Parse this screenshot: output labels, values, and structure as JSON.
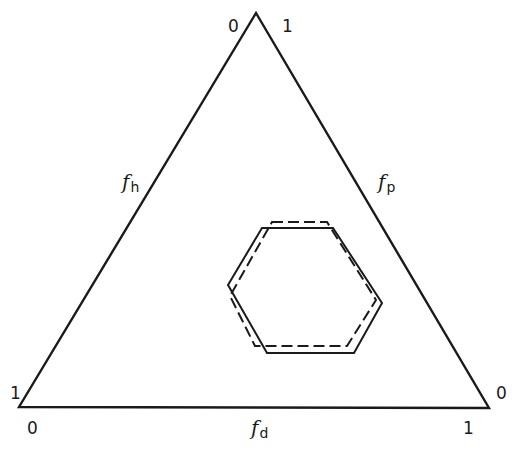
{
  "diagram": {
    "type": "ternary-triangle",
    "colors": {
      "line": "#1a1a1a",
      "background": "#ffffff"
    },
    "triangle": {
      "vertices": {
        "top": [
          256,
          13
        ],
        "left": [
          19,
          407
        ],
        "right": [
          489,
          408
        ]
      }
    },
    "axes": {
      "left": {
        "symbol": "f",
        "subscript": "h",
        "start_label": "1",
        "end_label": "0"
      },
      "right": {
        "symbol": "f",
        "subscript": "p",
        "start_label": "1",
        "end_label": "0"
      },
      "bottom": {
        "symbol": "f",
        "subscript": "d",
        "start_label": "0",
        "end_label": "1"
      }
    },
    "corner_labels": {
      "top_left": "0",
      "top_right": "1",
      "left_above": "1",
      "left_below": "0",
      "right_above": "0",
      "right_below": "1"
    },
    "hexagons": [
      {
        "name": "solid",
        "style": "solid",
        "points": "262,228 333,228 382,303 354,353 267,353 228,285"
      },
      {
        "name": "dashed",
        "style": "dashed",
        "points": "272,222 327,222 376,300 347,346 255,346 230,296"
      }
    ]
  }
}
